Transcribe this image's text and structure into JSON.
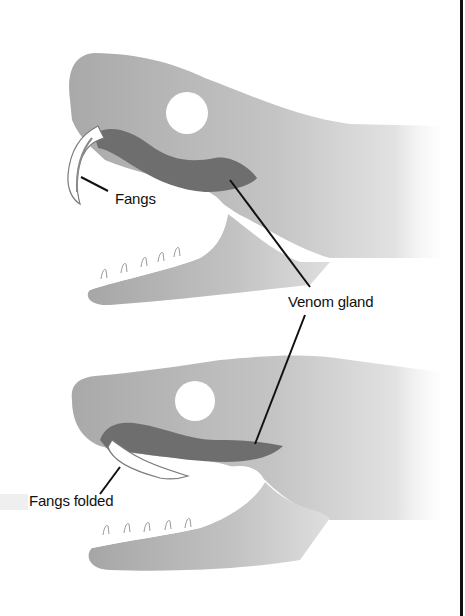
{
  "diagram": {
    "panels": [
      {
        "id": "open",
        "description": "Snake head with mouth open and fangs erect",
        "labels": {
          "fangs": "Fangs"
        }
      },
      {
        "id": "folded",
        "description": "Snake head with fangs folded back",
        "labels": {
          "fangs": "Fangs folded"
        }
      }
    ],
    "shared_label": "Venom gland",
    "colors": {
      "head": "#b0b0b0",
      "head_light": "#e6e6e6",
      "venom_gland": "#6e6e6e",
      "fang": "#ffffff",
      "fang_outline": "#7a7a7a",
      "eye": "#ffffff",
      "leader_line": "#111111",
      "border": "#111111"
    },
    "teeth_count_per_jaw": 5
  }
}
